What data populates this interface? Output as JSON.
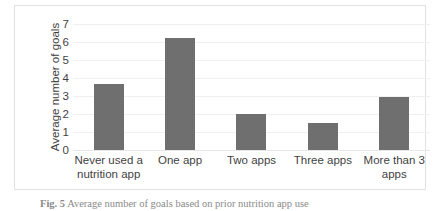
{
  "chart_data": {
    "type": "bar",
    "title": "",
    "xlabel": "",
    "ylabel": "Average number of goals",
    "categories": [
      "Never used a nutrition app",
      "One app",
      "Two apps",
      "Three apps",
      "More than 3 apps"
    ],
    "values": [
      3.65,
      6.25,
      2.0,
      1.5,
      2.95
    ],
    "ylim": [
      0,
      7
    ],
    "yticks": [
      "0",
      "1",
      "2",
      "3",
      "4",
      "5",
      "6",
      "7"
    ],
    "grid": true,
    "legend": false,
    "bar_color": "#6f6f6f",
    "gridline_color": "#f0f0f0",
    "frame_color": "#e2e2e2"
  },
  "caption": {
    "tag": "Fig. 5",
    "text": "Average number of goals based on prior nutrition app use"
  }
}
